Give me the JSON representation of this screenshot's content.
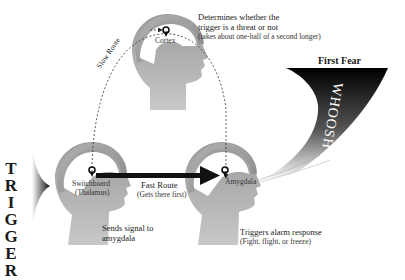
{
  "trigger": {
    "letters": [
      "T",
      "R",
      "I",
      "G",
      "G",
      "E",
      "R"
    ]
  },
  "cortex": {
    "label": "Cortex",
    "description_line1": "Determines whether the",
    "description_line2": "trigger is a threat or not",
    "note": "(takes about one-half of a second longer)"
  },
  "switchboard": {
    "label_line1": "Switchboard",
    "label_line2": "(Thalamus)",
    "description_line1": "Sends signal to",
    "description_line2": "amygdala"
  },
  "amygdala": {
    "label": "Amygdala",
    "description": "Triggers alarm response",
    "note": "(Fight, flight, or freeze)"
  },
  "routes": {
    "slow_label": "Slow Route",
    "fast_label": "Fast Route",
    "fast_note": "(Gets there first)"
  },
  "first_fear": {
    "title": "First Fear",
    "whoosh": "WHOOSH"
  },
  "colors": {
    "head_dark": "#7a7a7a",
    "head_light": "#d6d6d6",
    "arrow": "#111111",
    "whoosh_dark": "#000000"
  }
}
